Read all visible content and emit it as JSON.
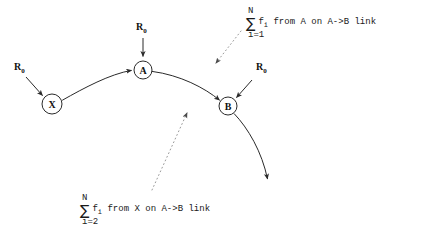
{
  "canvas": {
    "width": 422,
    "height": 250,
    "background": "#ffffff",
    "stroke_color": "#2a2a2a",
    "leader_color": "#9a9a9a"
  },
  "nodes": [
    {
      "id": "X",
      "label": "X",
      "cx": 52,
      "cy": 104,
      "r": 10
    },
    {
      "id": "A",
      "label": "A",
      "cx": 143,
      "cy": 70,
      "r": 9
    },
    {
      "id": "B",
      "label": "B",
      "cx": 228,
      "cy": 106,
      "r": 9
    }
  ],
  "inputs": [
    {
      "id": "r0-x",
      "label": "R",
      "subscript": "0",
      "x": 14,
      "y": 62
    },
    {
      "id": "r0-a",
      "label": "R",
      "subscript": "0",
      "x": 136,
      "y": 22
    },
    {
      "id": "r0-b",
      "label": "R",
      "subscript": "0",
      "x": 256,
      "y": 62
    }
  ],
  "annotations": [
    {
      "id": "sum-from-a",
      "upper": "N",
      "sigma": "∑",
      "body_prefix": "f",
      "body_sub": "i",
      "body_text": "  from A on A->B link",
      "lower": "i=1",
      "x": 246,
      "y": 6
    },
    {
      "id": "sum-from-x",
      "upper": "N",
      "sigma": "∑",
      "body_prefix": "f",
      "body_sub": "i",
      "body_text": "  from X on A->B link",
      "lower": "i=2",
      "x": 80,
      "y": 193
    }
  ],
  "edges": [
    {
      "id": "x-to-a",
      "from": "X",
      "to": "A",
      "kind": "arc"
    },
    {
      "id": "a-to-b",
      "from": "A",
      "to": "B",
      "kind": "arc"
    },
    {
      "id": "b-outgoing",
      "from": "B",
      "to": "open",
      "kind": "arc"
    },
    {
      "id": "r0-into-x",
      "from": "r0-x",
      "to": "X",
      "kind": "straight"
    },
    {
      "id": "r0-into-a",
      "from": "r0-a",
      "to": "A",
      "kind": "straight"
    },
    {
      "id": "r0-into-b",
      "from": "r0-b",
      "to": "B",
      "kind": "straight"
    }
  ],
  "leaders": [
    {
      "id": "leader-sum-from-a",
      "from": "sum-from-a",
      "to_x": 212,
      "to_y": 67
    },
    {
      "id": "leader-sum-from-x",
      "from": "sum-from-x",
      "to_x": 185,
      "to_y": 108
    }
  ]
}
